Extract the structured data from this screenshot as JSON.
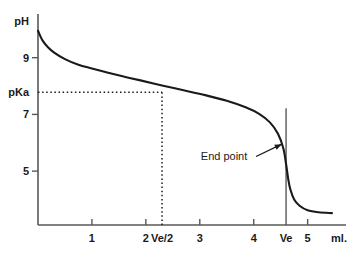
{
  "chart_data": {
    "type": "line",
    "title": "",
    "subtitle": "",
    "xlabel": "ml.",
    "ylabel": "pH",
    "xlim": [
      0,
      5.6
    ],
    "ylim": [
      3.1,
      10.4
    ],
    "grid": false,
    "legend": null,
    "x_ticks": [
      {
        "value": 1,
        "label": "1"
      },
      {
        "value": 2,
        "label": "2"
      },
      {
        "value": 2.3,
        "label": "Ve/2"
      },
      {
        "value": 3,
        "label": "3"
      },
      {
        "value": 4,
        "label": "4"
      },
      {
        "value": 4.6,
        "label": "Ve"
      },
      {
        "value": 5,
        "label": "5"
      }
    ],
    "y_ticks": [
      {
        "value": 9,
        "label": "9"
      },
      {
        "value": 7.78,
        "label": "pKa"
      },
      {
        "value": 7,
        "label": "7"
      },
      {
        "value": 5,
        "label": "5"
      }
    ],
    "series": [
      {
        "name": "titration curve",
        "x": [
          0.0,
          0.08,
          0.18,
          0.3,
          0.5,
          0.75,
          1.0,
          1.3,
          1.6,
          1.9,
          2.3,
          2.7,
          3.1,
          3.5,
          3.85,
          4.1,
          4.3,
          4.45,
          4.55,
          4.6,
          4.64,
          4.68,
          4.75,
          4.85,
          5.0,
          5.2,
          5.45
        ],
        "y": [
          9.95,
          9.62,
          9.38,
          9.18,
          8.95,
          8.75,
          8.62,
          8.47,
          8.33,
          8.2,
          8.02,
          7.85,
          7.68,
          7.48,
          7.25,
          7.02,
          6.72,
          6.32,
          5.8,
          5.25,
          4.72,
          4.35,
          4.0,
          3.78,
          3.62,
          3.55,
          3.52
        ]
      }
    ],
    "guides": [
      {
        "name": "pka-horizontal-dotted",
        "orientation": "horizontal",
        "value": 7.78,
        "from": 0,
        "to": 2.3,
        "style": "dotted"
      },
      {
        "name": "ve-half-vertical-dotted",
        "orientation": "vertical",
        "value": 2.3,
        "from": 3.1,
        "to": 7.78,
        "style": "dotted"
      },
      {
        "name": "ve-vertical-solid",
        "orientation": "vertical",
        "value": 4.6,
        "from": 3.1,
        "to": 7.22,
        "style": "solid"
      }
    ],
    "annotations": [
      {
        "name": "end-point",
        "text": "End point",
        "x": 3.45,
        "y": 5.55,
        "arrow_to_x": 4.52,
        "arrow_to_y": 5.95
      }
    ]
  },
  "axis_labels": {
    "y_title": "pH",
    "x_unit": "ml."
  },
  "colors": {
    "background": "#ffffff",
    "axis": "#58585a",
    "curve": "#1a1a1a",
    "text": "#1a1a1a",
    "guide": "#1a1a1a"
  }
}
